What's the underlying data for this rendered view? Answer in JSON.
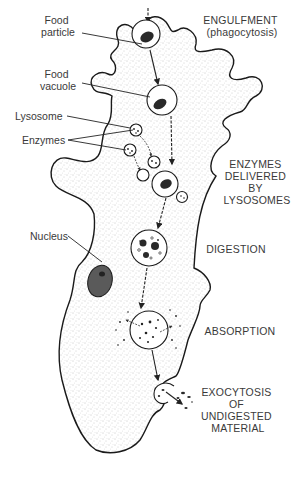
{
  "diagram": {
    "labels": {
      "food_particle": [
        "Food",
        "particle"
      ],
      "food_vacuole": [
        "Food",
        "vacuole"
      ],
      "lysosome": "Lysosome",
      "enzymes": "Enzymes",
      "nucleus": "Nucleus"
    },
    "stages": {
      "engulfment": [
        "ENGULFMENT",
        "(phagocytosis)"
      ],
      "enzymes_delivered": [
        "ENZYMES",
        "DELIVERED",
        "BY",
        "LYSOSOMES"
      ],
      "digestion": [
        "DIGESTION"
      ],
      "absorption": [
        "ABSORPTION"
      ],
      "exocytosis": [
        "EXOCYTOSIS",
        "OF",
        "UNDIGESTED",
        "MATERIAL"
      ]
    },
    "colors": {
      "outline": "#1a1a1a",
      "text": "#3a3a3a",
      "stipple": "#8a8a8a",
      "background": "#ffffff"
    }
  }
}
